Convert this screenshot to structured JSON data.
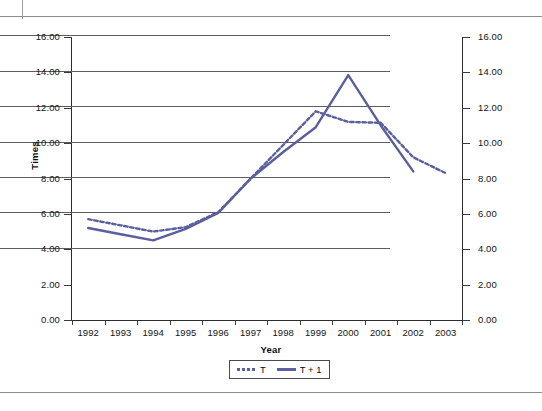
{
  "chart_data": {
    "type": "line",
    "title": "",
    "xlabel": "Year",
    "ylabel": "Times",
    "grid": true,
    "legend_position": "bottom",
    "ylim": [
      0,
      16
    ],
    "ytick_step": 2,
    "y_ticks": [
      "0.00",
      "2.00",
      "4.00",
      "6.00",
      "8.00",
      "10.00",
      "12.00",
      "14.00",
      "16.00"
    ],
    "y_axis_right": true,
    "y_ticks_right": [
      "0.00",
      "2.00",
      "4.00",
      "6.00",
      "8.00",
      "10.00",
      "12.00",
      "14.00",
      "16.00"
    ],
    "categories": [
      "1992",
      "1993",
      "1994",
      "1995",
      "1996",
      "1997",
      "1998",
      "1999",
      "2000",
      "2001",
      "2002",
      "2003"
    ],
    "series": [
      {
        "name": "T",
        "style": "dotted",
        "color": "#5a5f9e",
        "values": [
          5.7,
          5.35,
          5.0,
          5.25,
          6.1,
          8.0,
          9.9,
          11.8,
          11.2,
          11.15,
          9.2,
          8.3
        ]
      },
      {
        "name": "T + 1",
        "style": "solid",
        "color": "#5a5f9e",
        "values": [
          5.2,
          4.85,
          4.5,
          5.15,
          6.05,
          8.0,
          9.5,
          10.9,
          13.85,
          11.0,
          8.4,
          null
        ]
      }
    ]
  },
  "legend": {
    "items": [
      {
        "label": "T",
        "style": "dotted"
      },
      {
        "label": "T + 1",
        "style": "solid"
      }
    ]
  },
  "colors": {
    "series": "#5a5f9e",
    "grid": "#5c5c5c",
    "axis": "#2b2b2b",
    "rule": "#8d8d8d"
  }
}
